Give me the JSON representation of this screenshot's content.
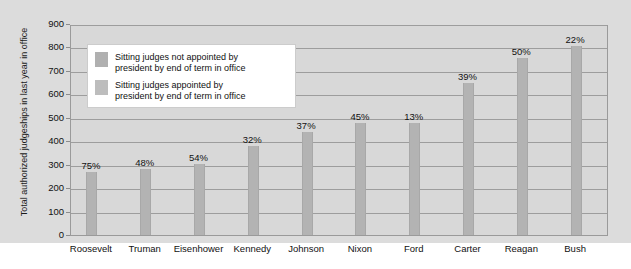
{
  "chart_data": {
    "type": "bar",
    "title": "",
    "xlabel": "",
    "ylabel": "Total authorized judgeships in last year in office",
    "ylim": [
      0,
      900
    ],
    "ytick_step": 100,
    "grid": true,
    "yticks": [
      "900",
      "800",
      "700",
      "600",
      "500",
      "400",
      "300",
      "200",
      "100",
      "0"
    ],
    "categories": [
      "Roosevelt",
      "Truman",
      "Eisenhower",
      "Kennedy",
      "Johnson",
      "Nixon",
      "Ford",
      "Carter",
      "Reagan",
      "Bush"
    ],
    "values": [
      270,
      282,
      303,
      380,
      440,
      479,
      479,
      650,
      753,
      805
    ],
    "point_labels": [
      "75%",
      "48%",
      "54%",
      "32%",
      "37%",
      "45%",
      "13%",
      "39%",
      "50%",
      "22%"
    ],
    "series": [
      {
        "name": "Sitting judges not appointed by\npresident by end of term in office",
        "color": "#b0b0b0"
      },
      {
        "name": "Sitting judges appointed by\npresident by end of term in office",
        "color": "#bdbdbd"
      }
    ],
    "legend_position": "upper-left-inside",
    "bar_color": "#b3b3b3",
    "plot_background": "#d8d8d8",
    "panel_background": "#dcdcdc"
  }
}
